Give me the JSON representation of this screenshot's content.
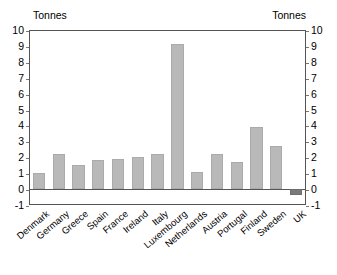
{
  "chart_data": {
    "type": "bar",
    "title": "",
    "xlabel": "",
    "ylabel": "Tonnes",
    "unit_label_left": "Tonnes",
    "unit_label_right": "Tonnes",
    "ylim": [
      -1,
      10
    ],
    "yticks": [
      10,
      9,
      8,
      7,
      6,
      5,
      4,
      3,
      2,
      1,
      0,
      -1
    ],
    "ytick_labels": [
      "10",
      "9",
      "8",
      "7",
      "6",
      "5",
      "4",
      "3",
      "2",
      "1",
      "0",
      "-1"
    ],
    "grid": false,
    "legend": "none",
    "dual_axis": true,
    "categories": [
      "Denmark",
      "Germany",
      "Greece",
      "Spain",
      "France",
      "Ireland",
      "Italy",
      "Luxembourg",
      "Netherlands",
      "Austria",
      "Portugal",
      "Finland",
      "Sweden",
      "UK"
    ],
    "values": [
      1.0,
      2.2,
      1.5,
      1.8,
      1.9,
      2.0,
      2.2,
      9.1,
      1.1,
      2.2,
      1.7,
      3.9,
      2.7,
      -0.35
    ],
    "bar_color": "#b9b9b9",
    "negative_bar_color": "#7a7a7a",
    "axis_color": "#555555"
  }
}
